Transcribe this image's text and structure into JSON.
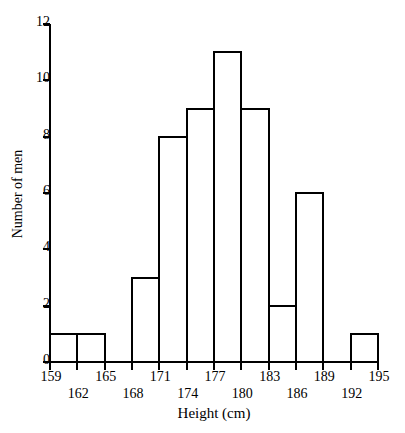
{
  "chart_data": {
    "type": "bar",
    "title": "",
    "subtitle": "",
    "xlabel": "Height (cm)",
    "ylabel": "Number of men",
    "grid": false,
    "legend": "none",
    "bin_width": 3,
    "bin_edges": [
      159,
      162,
      165,
      168,
      171,
      174,
      177,
      180,
      183,
      186,
      189,
      192,
      195
    ],
    "categories": [
      "159-162",
      "162-165",
      "165-168",
      "168-171",
      "171-174",
      "174-177",
      "177-180",
      "180-183",
      "183-186",
      "186-189",
      "189-192",
      "192-195"
    ],
    "values": [
      1,
      1,
      0,
      3,
      8,
      9,
      11,
      9,
      2,
      6,
      0,
      1
    ],
    "xlim": [
      159,
      195
    ],
    "ylim": [
      0,
      12
    ],
    "xticks": [
      159,
      162,
      165,
      168,
      171,
      174,
      177,
      180,
      183,
      186,
      189,
      192,
      195
    ],
    "xtick_labels": [
      "159",
      "162",
      "165",
      "168",
      "171",
      "174",
      "177",
      "180",
      "183",
      "186",
      "189",
      "192",
      "195"
    ],
    "yticks": [
      0,
      2,
      4,
      6,
      8,
      10,
      12
    ],
    "ytick_labels": [
      "0",
      "2",
      "4",
      "6",
      "8",
      "10",
      "12"
    ],
    "bar_color": "#ffffff",
    "bar_edge_color": "#000000",
    "axis_color": "#000000",
    "background_color": "#ffffff"
  }
}
